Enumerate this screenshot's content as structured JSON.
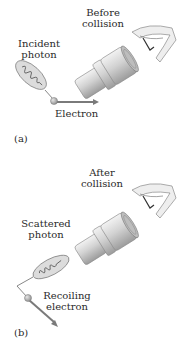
{
  "figure": {
    "panel_a": {
      "label": "(a)",
      "title_line1": "Before",
      "title_line2": "collision",
      "photon_line1": "Incident",
      "photon_line2": "photon",
      "particle": "Electron"
    },
    "panel_b": {
      "label": "(b)",
      "title_line1": "After",
      "title_line2": "collision",
      "photon_line1": "Scattered",
      "photon_line2": "photon",
      "particle_line1": "Recoiling",
      "particle_line2": "electron"
    },
    "colors": {
      "microscope_body": "#c9c9c9",
      "microscope_shade": "#9a9a9a",
      "photon_ellipse_fill": "#d8d8d8",
      "electron_fill": "#b0b0b0",
      "arrow": "#7a7a7a",
      "text": "#2a2a2a"
    },
    "icons": [
      "microscope-icon",
      "eye-icon",
      "photon-wave-icon",
      "electron-icon",
      "arrow-icon"
    ]
  }
}
